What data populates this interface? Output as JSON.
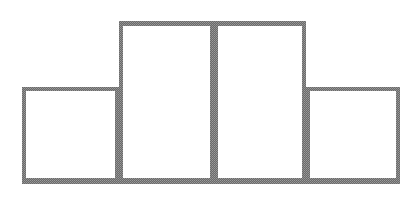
{
  "figure": {
    "title": "",
    "background_color": "#ffffff",
    "width": 416,
    "height": 201
  },
  "chart_data": {
    "type": "bar",
    "title": "",
    "subtitle": "",
    "xlabel": "",
    "ylabel": "",
    "categories": [
      "1",
      "2",
      "3",
      "4"
    ],
    "values": [
      95,
      160,
      160,
      95
    ],
    "ylim": [
      0,
      180
    ],
    "xlim": [
      0,
      4
    ],
    "grid": false,
    "legend": null,
    "axis_visible": false,
    "tick_labels_x": [],
    "tick_labels_y": [],
    "annotations": [],
    "style": {
      "bar_fill": "none",
      "bar_edge_color": "#6a6a6a",
      "bar_edge_width": 4,
      "bars_adjacent": true,
      "outline_only": true,
      "texture": "dithered-halftone"
    },
    "bar_geometry": [
      {
        "name": "bar-1",
        "x0": 22,
        "x1": 119,
        "top": 87,
        "bottom": 182
      },
      {
        "name": "bar-2",
        "x0": 119,
        "x1": 214,
        "top": 22,
        "bottom": 182
      },
      {
        "name": "bar-3",
        "x0": 214,
        "x1": 306,
        "top": 22,
        "bottom": 182
      },
      {
        "name": "bar-4",
        "x0": 306,
        "x1": 400,
        "top": 87,
        "bottom": 182
      }
    ],
    "baseline_y": 182
  }
}
